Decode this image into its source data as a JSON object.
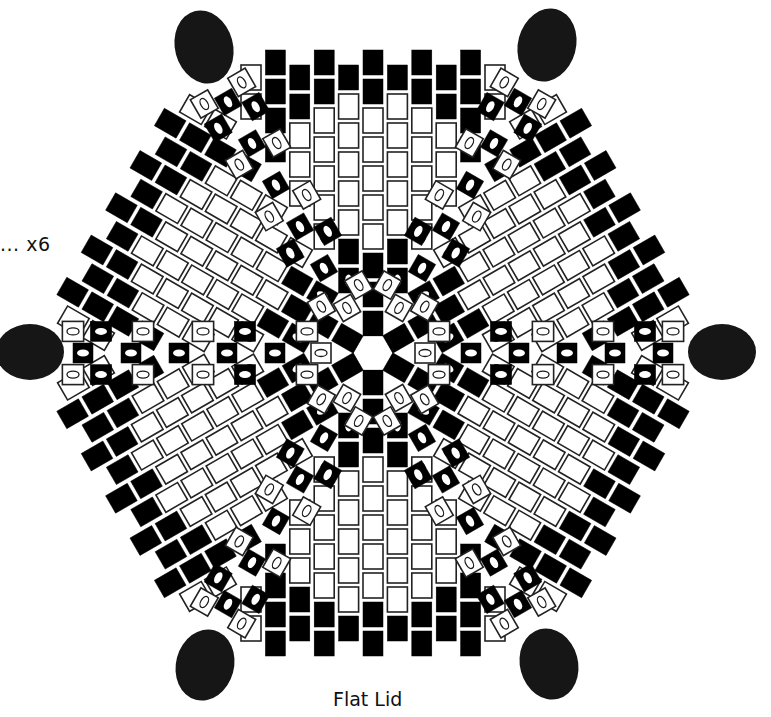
{
  "diagram": {
    "title": "Flat Lid",
    "repeat_label": "... x6",
    "colors": {
      "black": "#000000",
      "white": "#ffffff",
      "outline": "#222222",
      "oval": "#1a1a1a"
    },
    "center": [
      373,
      353
    ],
    "column_pitch": 24.4,
    "row_pitch": 29,
    "bead_width": 20,
    "bead_height": 25,
    "wedge_count": 6,
    "wedge_columns": [
      {
        "offset": -4,
        "top": 50,
        "beads": "BBBM"
      },
      {
        "offset": -3,
        "top": 65,
        "beads": "BBWWO"
      },
      {
        "offset": -2,
        "top": 50,
        "beads": "BBWWWWO"
      },
      {
        "offset": -1,
        "top": 65,
        "beads": "BWWWWWBM"
      },
      {
        "offset": 0,
        "top": 50,
        "beads": "BBWWWWWBBB"
      },
      {
        "offset": 1,
        "top": 65,
        "beads": "BWWWWWBM"
      },
      {
        "offset": 2,
        "top": 50,
        "beads": "BBWWWWO"
      },
      {
        "offset": 3,
        "top": 65,
        "beads": "BBWWO"
      },
      {
        "offset": 4,
        "top": 50,
        "beads": "BBBM"
      }
    ],
    "edge_beads": [
      {
        "offset": -5,
        "top": 65,
        "beads": "WO"
      },
      {
        "offset": 5,
        "top": 65,
        "beads": "WO"
      }
    ],
    "spoke_beads": [
      {
        "dist": 52,
        "type": "O"
      },
      {
        "dist": 98,
        "type": "M"
      },
      {
        "dist": 146,
        "type": "M"
      },
      {
        "dist": 194,
        "type": "M"
      },
      {
        "dist": 242,
        "type": "M"
      },
      {
        "dist": 290,
        "type": "M"
      }
    ],
    "spoke_side_beads": [
      {
        "dist": 66,
        "side": 24,
        "type": "O"
      },
      {
        "dist": 128,
        "side": 24,
        "type": "M"
      },
      {
        "dist": 170,
        "side": 24,
        "type": "O"
      },
      {
        "dist": 230,
        "side": 24,
        "type": "O"
      },
      {
        "dist": 272,
        "side": 24,
        "type": "M"
      },
      {
        "dist": 300,
        "side": 24,
        "type": "O"
      }
    ],
    "corner_ovals": [
      {
        "cx": 204,
        "cy": 47,
        "rx": 29,
        "ry": 37,
        "rot": -15
      },
      {
        "cx": 547,
        "cy": 45,
        "rx": 29,
        "ry": 37,
        "rot": 15
      },
      {
        "cx": 30,
        "cy": 352,
        "rx": 34,
        "ry": 28,
        "rot": 0
      },
      {
        "cx": 722,
        "cy": 352,
        "rx": 34,
        "ry": 28,
        "rot": 0
      },
      {
        "cx": 205,
        "cy": 665,
        "rx": 29,
        "ry": 36,
        "rot": 15
      },
      {
        "cx": 549,
        "cy": 664,
        "rx": 29,
        "ry": 36,
        "rot": -15
      }
    ]
  }
}
